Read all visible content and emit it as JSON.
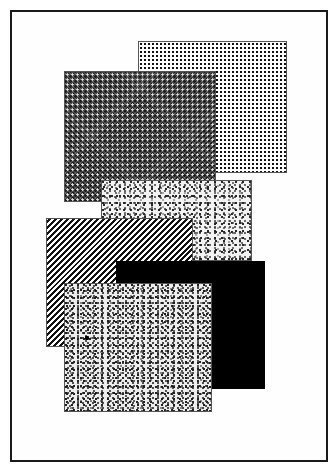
{
  "figure": {
    "frame": {
      "left": 10,
      "top": 10,
      "right": 326,
      "bottom": 460,
      "border_color": "#1a1a1a"
    },
    "rectangles": [
      {
        "id": "dot-grid",
        "pattern": "dotted-grid",
        "z": 1,
        "left": 138,
        "top": 41,
        "right": 287,
        "bottom": 173,
        "color": "#111111"
      },
      {
        "id": "crosshatch",
        "pattern": "dark-crosshatch",
        "z": 2,
        "left": 64,
        "top": 71,
        "right": 216,
        "bottom": 202,
        "color": "#1c1c1c"
      },
      {
        "id": "speckle-back",
        "pattern": "speckle",
        "z": 3,
        "left": 101,
        "top": 180,
        "right": 252,
        "bottom": 261,
        "color": "#222222"
      },
      {
        "id": "stripes",
        "pattern": "diagonal-stripes",
        "z": 4,
        "left": 46,
        "top": 218,
        "right": 193,
        "bottom": 347,
        "color": "#111111"
      },
      {
        "id": "solid-black",
        "pattern": "solid",
        "z": 5,
        "left": 116,
        "top": 261,
        "right": 265,
        "bottom": 389,
        "color": "#000000"
      },
      {
        "id": "speckle-front",
        "pattern": "speckle-dense",
        "z": 6,
        "left": 64,
        "top": 283,
        "right": 212,
        "bottom": 412,
        "color": "#1e1e1e"
      }
    ]
  }
}
